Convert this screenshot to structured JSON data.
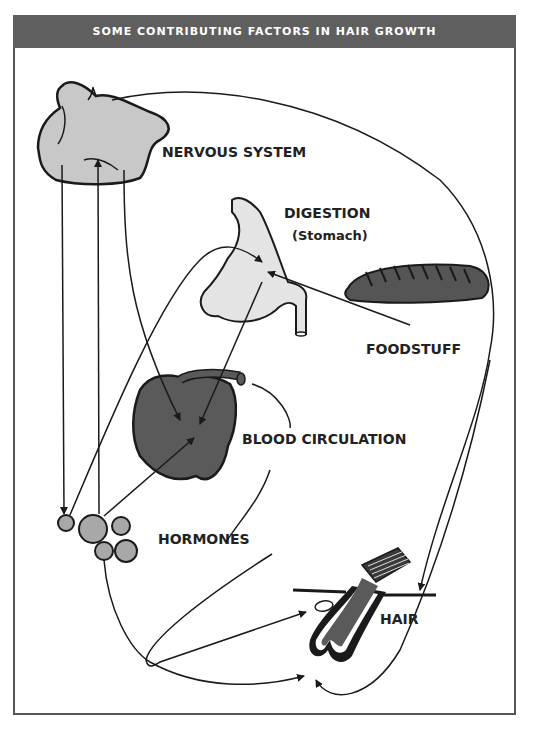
{
  "header": {
    "title": "SOME CONTRIBUTING FACTORS IN HAIR GROWTH"
  },
  "labels": {
    "nervous_system": "NERVOUS SYSTEM",
    "digestion": "DIGESTION",
    "stomach": "(Stomach)",
    "foodstuff": "FOODSTUFF",
    "blood_circulation": "BLOOD CIRCULATION",
    "hormones": "HORMONES",
    "hair": "HAIR"
  },
  "colors": {
    "header_bg": "#5f5f5f",
    "light_fill": "#c8c8c8",
    "stomach_fill": "#e4e4e4",
    "dark_fill": "#5a5a5a",
    "hormone_fill": "#a8a8a8",
    "stroke": "#1a1a1a"
  }
}
